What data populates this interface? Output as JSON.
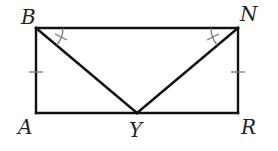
{
  "diagram": {
    "type": "geometry",
    "shape": "rectangle with two diagonals from top corners to bottom midpoint",
    "points": {
      "B": {
        "label": "B",
        "x": 36,
        "y": 28
      },
      "N": {
        "label": "N",
        "x": 238,
        "y": 28
      },
      "A": {
        "label": "A",
        "x": 36,
        "y": 113
      },
      "R": {
        "label": "R",
        "x": 238,
        "y": 113
      },
      "Y": {
        "label": "Y",
        "x": 137,
        "y": 113
      }
    },
    "segments": [
      "BN",
      "BA",
      "NR",
      "AR",
      "BY",
      "NY"
    ],
    "congruence_marks": {
      "sides": [
        "BA",
        "NR"
      ],
      "angles": [
        "NBY",
        "BNY"
      ]
    },
    "colors": {
      "line": "#111111",
      "marks": "#777777",
      "labels": "#222222"
    }
  }
}
